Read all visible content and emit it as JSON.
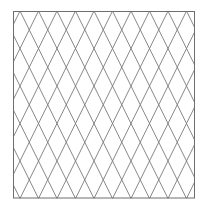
{
  "figure": {
    "type": "diamond-lattice",
    "background": "#ffffff",
    "border": {
      "x": 13,
      "y": 11,
      "width": 182,
      "height": 187.5,
      "color": "#6e6e6e",
      "stroke_width": 1
    },
    "lattice": {
      "line_color": "#7a7a7a",
      "line_width": 0.9,
      "top_vertex_x0": 20,
      "horizontal_period": 18.5,
      "vertical_period": 37.5,
      "columns_visible": 10,
      "rows_visible": 5
    }
  }
}
